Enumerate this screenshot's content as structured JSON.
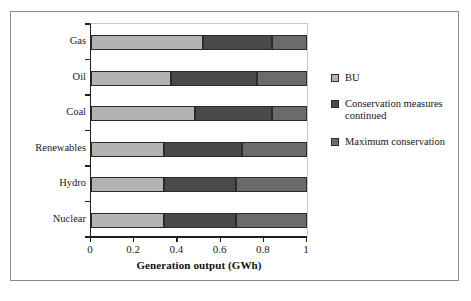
{
  "chart_data": {
    "type": "bar",
    "orientation": "horizontal",
    "stacked": true,
    "title": "",
    "xlabel": "Generation output (GWh)",
    "ylabel": "",
    "xlim": [
      0,
      1
    ],
    "xticks": [
      "0",
      "0.2",
      "0.4",
      "0.6",
      "0.8",
      "1"
    ],
    "xtick_values": [
      0,
      0.2,
      0.4,
      0.6,
      0.8,
      1
    ],
    "grid": false,
    "legend_position": "right",
    "categories": [
      "Gas",
      "Oil",
      "Coal",
      "Renewables",
      "Hydro",
      "Nuclear"
    ],
    "series": [
      {
        "name": "BU",
        "color": "#b3b3b3",
        "values": [
          0.52,
          0.37,
          0.48,
          0.34,
          0.34,
          0.34
        ]
      },
      {
        "name": "Conservation measures continued",
        "color": "#4a4a4a",
        "values": [
          0.32,
          0.4,
          0.36,
          0.36,
          0.33,
          0.33
        ]
      },
      {
        "name": "Maximum conservation",
        "color": "#6b6b6b",
        "values": [
          0.16,
          0.23,
          0.16,
          0.3,
          0.33,
          0.33
        ]
      }
    ],
    "segment_boundaries": [
      [
        0.52,
        0.84,
        1.0
      ],
      [
        0.37,
        0.77,
        1.0
      ],
      [
        0.48,
        0.84,
        1.0
      ],
      [
        0.34,
        0.7,
        1.0
      ],
      [
        0.34,
        0.67,
        1.0
      ],
      [
        0.34,
        0.67,
        1.0
      ]
    ]
  },
  "legend": {
    "entries": [
      {
        "label": "BU",
        "color": "#b3b3b3"
      },
      {
        "label": "Conservation measures continued",
        "color": "#4a4a4a"
      },
      {
        "label": "Maximum conservation",
        "color": "#6b6b6b"
      }
    ]
  },
  "axis": {
    "x_title": "Generation output (GWh)"
  },
  "colors": {
    "frame": "#8a8a8a",
    "axis": "#231f20",
    "text": "#1a1a1a",
    "background": "#ffffff"
  }
}
